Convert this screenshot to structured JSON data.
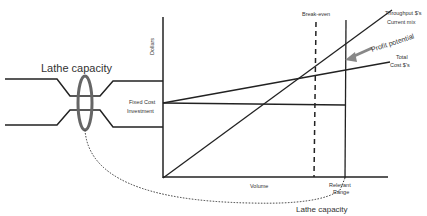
{
  "diagram": {
    "axes": {
      "y_label": "Dollars",
      "x_label": "Volume"
    },
    "labels": {
      "lathe_top": "Lathe capacity",
      "lathe_bottom": "Lathe capacity",
      "fixed_cost_1": "Fixed Cost",
      "fixed_cost_2": "Investment",
      "break_even": "Break-even",
      "throughput_1": "Throughput $'s",
      "throughput_2": "Current mix",
      "profit_potential": "Profit potential",
      "total_cost_1": "Total",
      "total_cost_2": "Cost $'s",
      "relevant_1": "Relevant",
      "relevant_2": "Range"
    },
    "colors": {
      "line": "#222222",
      "ellipse": "#555555",
      "arrow": "#888888"
    }
  }
}
